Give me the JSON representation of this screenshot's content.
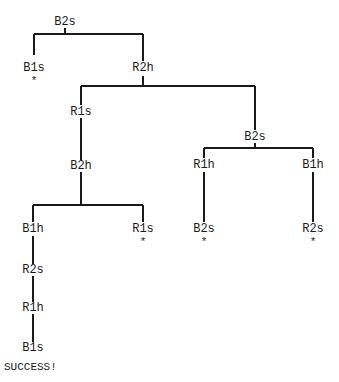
{
  "diagram": {
    "type": "search-tree",
    "nodes": {
      "root": {
        "label": "B2s"
      },
      "n1": {
        "label": "B1s",
        "marker": "*"
      },
      "n2": {
        "label": "R2h"
      },
      "n3": {
        "label": "R1s"
      },
      "n4": {
        "label": "B2s"
      },
      "n5": {
        "label": "B2h"
      },
      "n6": {
        "label": "R1h"
      },
      "n7": {
        "label": "B1h"
      },
      "n8": {
        "label": "B1h"
      },
      "n9": {
        "label": "R1s",
        "marker": "*"
      },
      "n10": {
        "label": "B2s",
        "marker": "*"
      },
      "n11": {
        "label": "R2s",
        "marker": "*"
      },
      "n12": {
        "label": "R2s"
      },
      "n13": {
        "label": "R1h"
      },
      "n14": {
        "label": "B1s"
      }
    },
    "edges": [
      [
        "root",
        "n1"
      ],
      [
        "root",
        "n2"
      ],
      [
        "n2",
        "n3"
      ],
      [
        "n2",
        "n4"
      ],
      [
        "n3",
        "n5"
      ],
      [
        "n4",
        "n6"
      ],
      [
        "n4",
        "n7"
      ],
      [
        "n5",
        "n8"
      ],
      [
        "n5",
        "n9"
      ],
      [
        "n6",
        "n10"
      ],
      [
        "n7",
        "n11"
      ],
      [
        "n8",
        "n12"
      ],
      [
        "n12",
        "n13"
      ],
      [
        "n13",
        "n14"
      ]
    ],
    "status": "SUCCESS!"
  }
}
